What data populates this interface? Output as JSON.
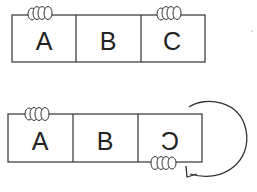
{
  "diagram": {
    "top_strip": {
      "panels": [
        {
          "label": "A",
          "mirrored": false
        },
        {
          "label": "B",
          "mirrored": false
        },
        {
          "label": "C",
          "mirrored": false
        }
      ],
      "fingers": [
        "top-over-A",
        "top-over-C"
      ]
    },
    "bottom_strip": {
      "panels": [
        {
          "label": "A",
          "mirrored": false
        },
        {
          "label": "B",
          "mirrored": false
        },
        {
          "label": "C",
          "mirrored": true
        }
      ],
      "fingers": [
        "top-over-A",
        "bottom-under-C"
      ],
      "arrow": "curved-rotation-arrow (clockwise flip around right edge)"
    },
    "colors": {
      "line": "#333333",
      "background": "#ffffff"
    }
  }
}
